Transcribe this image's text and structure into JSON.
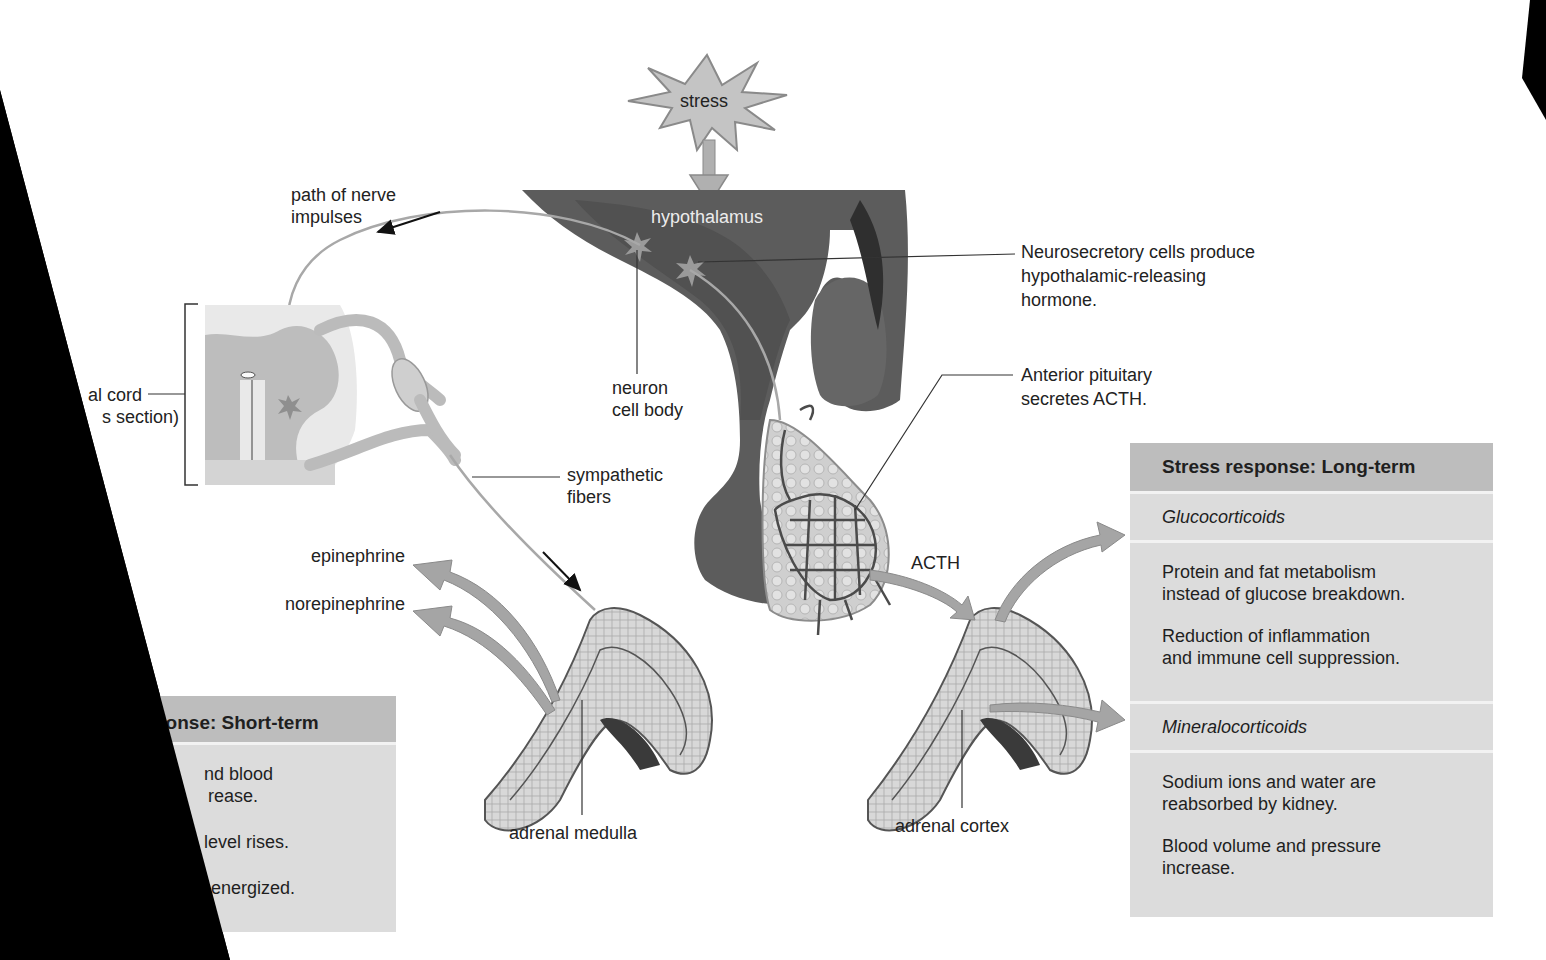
{
  "figure": {
    "stress_label": "stress",
    "hypothalamus_label": "hypothalamus",
    "path_of_nerve_impulses": [
      "path of nerve",
      "impulses"
    ],
    "spinal_cord_label": [
      "al cord",
      "s section)"
    ],
    "neuron_cell_body": [
      "neuron",
      "cell body"
    ],
    "sympathetic_fibers": [
      "sympathetic",
      "fibers"
    ],
    "neurosecretory_cells": [
      "Neurosecretory cells produce",
      "hypothalamic-releasing",
      "hormone."
    ],
    "anterior_pituitary": [
      "Anterior pituitary",
      "secretes ACTH."
    ],
    "acth_label": "ACTH",
    "epinephrine_label": "epinephrine",
    "norepinephrine_label": "norepinephrine",
    "adrenal_medulla_label": "adrenal medulla",
    "adrenal_cortex_label": "adrenal cortex"
  },
  "short_term_panel": {
    "header": "ponse: Short-term",
    "items": [
      [
        "nd blood",
        "rease."
      ],
      [
        "level rises."
      ],
      [
        "e energized."
      ]
    ]
  },
  "long_term_panel": {
    "header": "Stress response: Long-term",
    "sections": [
      {
        "title": "Glucocorticoids",
        "items": [
          [
            "Protein and fat metabolism",
            "instead of glucose breakdown."
          ],
          [
            "Reduction of inflammation",
            "and immune cell suppression."
          ]
        ]
      },
      {
        "title": "Mineralocorticoids",
        "items": [
          [
            "Sodium ions and water are",
            "reabsorbed by kidney."
          ],
          [
            "Blood volume and pressure",
            "increase."
          ]
        ]
      }
    ]
  },
  "colors": {
    "hypothalamus_dark": "#5a5a5a",
    "pituitary_mid": "#6e6e6e",
    "arrow_gray": "#a8a8a8",
    "panel_header": "#bdbdbd",
    "panel_body": "#dcdcdc"
  }
}
